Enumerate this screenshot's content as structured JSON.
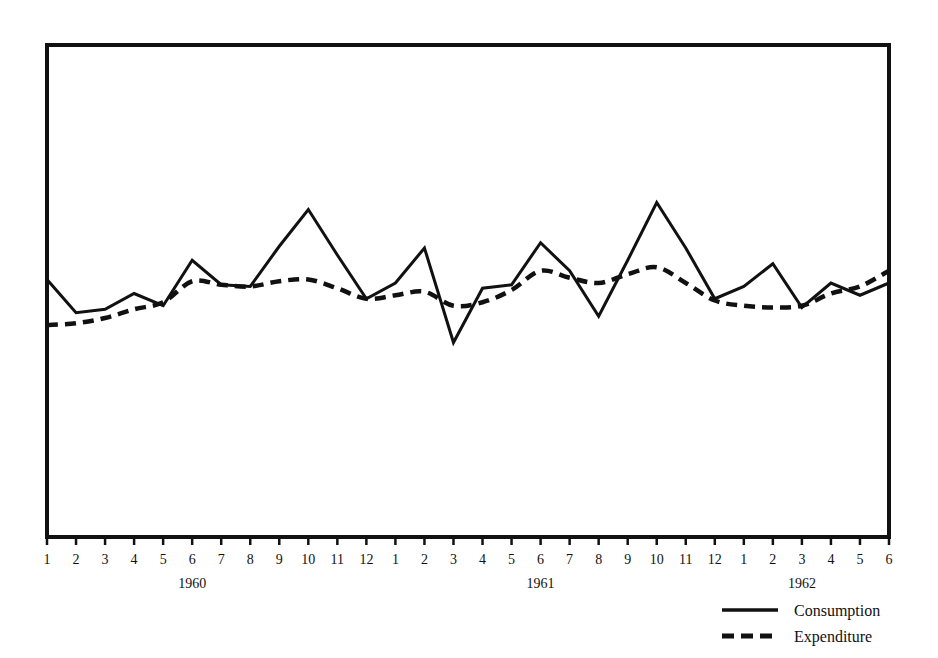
{
  "chart_data": {
    "type": "line",
    "title": "",
    "subtitle": "",
    "xlabel": "",
    "ylabel": "",
    "grid": false,
    "legend_position": "bottom-right",
    "x": [
      "1960-1",
      "1960-2",
      "1960-3",
      "1960-4",
      "1960-5",
      "1960-6",
      "1960-7",
      "1960-8",
      "1960-9",
      "1960-10",
      "1960-11",
      "1960-12",
      "1961-1",
      "1961-2",
      "1961-3",
      "1961-4",
      "1961-5",
      "1961-6",
      "1961-7",
      "1961-8",
      "1961-9",
      "1961-10",
      "1961-11",
      "1961-12",
      "1962-1",
      "1962-2",
      "1962-3",
      "1962-4",
      "1962-5",
      "1962-6"
    ],
    "tick_labels": [
      "1",
      "2",
      "3",
      "4",
      "5",
      "6",
      "7",
      "8",
      "9",
      "10",
      "11",
      "12",
      "1",
      "2",
      "3",
      "4",
      "5",
      "6",
      "7",
      "8",
      "9",
      "10",
      "11",
      "12",
      "1",
      "2",
      "3",
      "4",
      "5",
      "6"
    ],
    "year_groups": [
      {
        "label": "1960",
        "center_index": 5
      },
      {
        "label": "1961",
        "center_index": 17
      },
      {
        "label": "1962",
        "center_index": 26
      }
    ],
    "ylim": [
      0,
      100
    ],
    "series": [
      {
        "name": "Consumption",
        "style": "solid",
        "color": "#111111",
        "values": [
          63.0,
          53.5,
          54.5,
          59.0,
          55.5,
          68.5,
          61.5,
          61.0,
          72.5,
          83.0,
          70.0,
          57.5,
          62.0,
          72.0,
          45.0,
          60.5,
          61.5,
          73.5,
          65.5,
          52.5,
          68.5,
          85.0,
          72.0,
          57.5,
          61.0,
          67.5,
          55.0,
          62.0,
          58.5,
          62.0
        ]
      },
      {
        "name": "Expenditure",
        "style": "dashed",
        "color": "#111111",
        "values": [
          50.0,
          50.5,
          52.0,
          54.5,
          56.5,
          62.5,
          61.5,
          61.0,
          62.5,
          63.0,
          60.5,
          57.5,
          58.5,
          59.5,
          55.5,
          56.5,
          60.0,
          65.5,
          63.5,
          62.0,
          64.5,
          66.5,
          62.0,
          57.0,
          55.5,
          55.0,
          55.5,
          59.0,
          61.0,
          65.5
        ]
      }
    ],
    "legend": [
      {
        "label": "Consumption",
        "style": "solid"
      },
      {
        "label": "Expenditure",
        "style": "dashed"
      }
    ]
  },
  "frame": {
    "border_color": "#111111"
  }
}
